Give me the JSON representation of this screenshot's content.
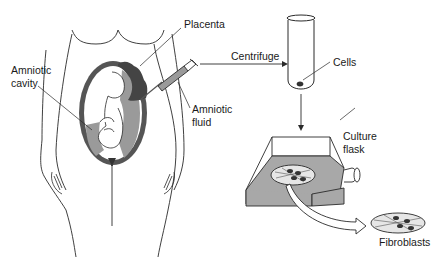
{
  "diagram": {
    "labels": {
      "placenta": "Placenta",
      "amniotic_cavity_line1": "Amniotic",
      "amniotic_cavity_line2": "cavity",
      "amniotic_fluid_line1": "Amniotic",
      "amniotic_fluid_line2": "fluid",
      "centrifuge": "Centrifuge",
      "cells": "Cells",
      "culture_flask_line1": "Culture",
      "culture_flask_line2": "flask",
      "fibroblasts": "Fibroblasts"
    },
    "colors": {
      "line": "#2a2a2a",
      "uterus_wall": "#555555",
      "fluid": "#9a9a9a",
      "flask_medium": "#a8a8a8",
      "cells": "#333333"
    },
    "flow": [
      "Amniotic fluid",
      "Centrifuge",
      "Cells",
      "Culture flask",
      "Fibroblasts"
    ]
  }
}
